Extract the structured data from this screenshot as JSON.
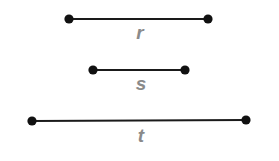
{
  "diagram": {
    "colors": {
      "line": "#1a1a1a",
      "point": "#111111",
      "label": "#8a8a8a",
      "background": "#ffffff"
    },
    "segments": [
      {
        "label": "r",
        "x1": 69,
        "y1": 19,
        "x2": 208,
        "y2": 19,
        "label_x": 140,
        "label_y": 39
      },
      {
        "label": "s",
        "x1": 93,
        "y1": 70,
        "x2": 185,
        "y2": 70,
        "label_x": 141,
        "label_y": 90
      },
      {
        "label": "t",
        "x1": 32,
        "y1": 121,
        "x2": 246,
        "y2": 120,
        "label_x": 141,
        "label_y": 142
      }
    ]
  }
}
